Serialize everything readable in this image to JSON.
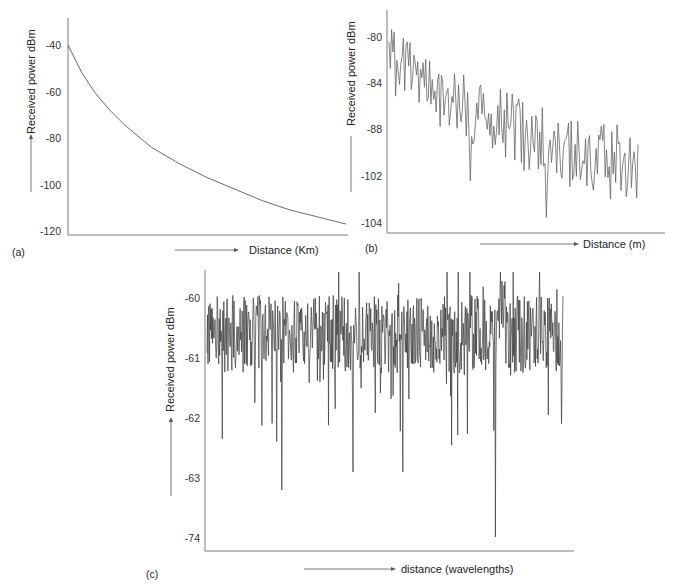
{
  "chart_data": [
    {
      "panel": "(a)",
      "type": "line",
      "title": "",
      "xlabel": "Distance (Km)",
      "ylabel": "Received power dBm",
      "yticks": [
        "-40",
        "-60",
        "-80",
        "-100",
        "-120"
      ],
      "ylim": [
        -120,
        -40
      ],
      "grid": false,
      "legend": null,
      "description": "Smooth monotonically decaying path-loss curve",
      "x": [
        0,
        0.05,
        0.1,
        0.15,
        0.2,
        0.3,
        0.4,
        0.5,
        0.6,
        0.7,
        0.8,
        0.9,
        1.0
      ],
      "values": [
        -40,
        -52,
        -61,
        -68,
        -74,
        -84,
        -91,
        -97,
        -102,
        -107,
        -111,
        -114,
        -117
      ]
    },
    {
      "panel": "(b)",
      "type": "line",
      "title": "",
      "xlabel": "Distance (m)",
      "ylabel": "Received power dBm",
      "yticks": [
        "-80",
        "-84",
        "-88",
        "-102",
        "-104"
      ],
      "grid": false,
      "legend": null,
      "description": "Noisy fluctuating signal trending downward from about -80 to about -100 (shadowing plus multipath)",
      "x_fraction": [
        0,
        0.1,
        0.2,
        0.3,
        0.4,
        0.5,
        0.6,
        0.7,
        0.8,
        0.9,
        1.0
      ],
      "trend_values_tick_units": [
        -82,
        -83,
        -85,
        -86,
        -87,
        -88,
        -89,
        -90,
        -90.5,
        -90.5,
        -91
      ]
    },
    {
      "panel": "(c)",
      "type": "line",
      "title": "",
      "xlabel": "distance (wavelengths)",
      "ylabel": "Received power dBm",
      "yticks": [
        "-60",
        "-61",
        "-62",
        "-63",
        "-74"
      ],
      "grid": false,
      "legend": null,
      "description": "Dense fast-fading signal around -60.5 dBm with deep downward fades; deepest fade reaches about -74 near 81% of the axis",
      "mean_level": -60.6,
      "deep_fades": [
        {
          "x_fraction": 0.21,
          "value": -63.2
        },
        {
          "x_fraction": 0.41,
          "value": -62.9
        },
        {
          "x_fraction": 0.55,
          "value": -62.9
        },
        {
          "x_fraction": 0.81,
          "value": -74
        }
      ]
    }
  ],
  "panels": {
    "a": {
      "label": "(a)",
      "xlabel": "Distance (Km)",
      "ylabel": "Received power dBm",
      "yticks": [
        "-40",
        "-60",
        "-80",
        "-100",
        "-120"
      ]
    },
    "b": {
      "label": "(b)",
      "xlabel": "Distance (m)",
      "ylabel": "Received power dBm",
      "yticks": [
        "-80",
        "-84",
        "-88",
        "-102",
        "-104"
      ]
    },
    "c": {
      "label": "(c)",
      "xlabel": "distance (wavelengths)",
      "ylabel": "Received power dBm",
      "yticks": [
        "-60",
        "-61",
        "-62",
        "-63",
        "-74"
      ]
    }
  },
  "colors": {
    "line": "#3a3a3a",
    "axis": "#7a7a7a"
  }
}
